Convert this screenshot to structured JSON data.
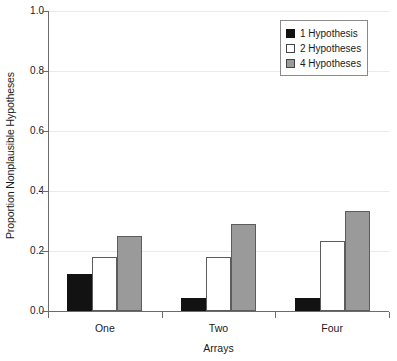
{
  "chart_data": {
    "type": "bar",
    "title": "",
    "xlabel": "Arrays",
    "ylabel": "Proportion Nonplausible Hypotheses",
    "categories": [
      "One",
      "Two",
      "Four"
    ],
    "series": [
      {
        "name": "1 Hypothesis",
        "values": [
          0.125,
          0.045,
          0.045
        ]
      },
      {
        "name": "2 Hypotheses",
        "values": [
          0.18,
          0.18,
          0.235
        ]
      },
      {
        "name": "4 Hypotheses",
        "values": [
          0.25,
          0.29,
          0.333
        ]
      }
    ],
    "ylim": [
      0.0,
      1.0
    ],
    "ytick_labels": [
      "0.0",
      "0.2",
      "0.4",
      "0.6",
      "0.8",
      "1.0"
    ],
    "ytick_values": [
      0.0,
      0.2,
      0.4,
      0.6,
      0.8,
      1.0
    ],
    "grid": true,
    "legend_position": "top-right",
    "colors": {
      "series_1": "#121212",
      "series_2": "#ffffff",
      "series_3": "#9a9a9a",
      "axis": "#6b6b6b",
      "grid": "#e9e9e9",
      "text": "#1a1a1a"
    }
  }
}
